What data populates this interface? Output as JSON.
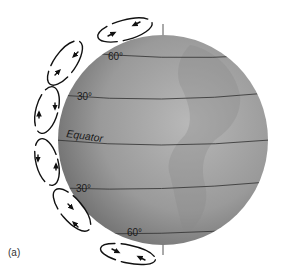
{
  "figure": {
    "panel_label": "(a)",
    "latitude_labels": {
      "north_60": "60°",
      "north_30": "30°",
      "equator": "Equator",
      "south_30": "30°",
      "south_60": "60°"
    },
    "colors": {
      "globe_light": "#b4b4b4",
      "globe_dark": "#6e6e6e",
      "lines": "#2a2a2a",
      "arrows": "#111111"
    },
    "cells": [
      {
        "name": "north-polar-cell",
        "rotation": "counterclockwise"
      },
      {
        "name": "north-ferrel-cell",
        "rotation": "clockwise"
      },
      {
        "name": "north-hadley-cell",
        "rotation": "counterclockwise"
      },
      {
        "name": "south-hadley-cell",
        "rotation": "clockwise"
      },
      {
        "name": "south-ferrel-cell",
        "rotation": "counterclockwise"
      },
      {
        "name": "south-polar-cell",
        "rotation": "clockwise"
      }
    ]
  }
}
